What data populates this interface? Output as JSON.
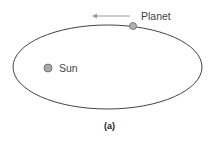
{
  "diagram": {
    "orbit": {
      "cx": 107.5,
      "cy": 67,
      "rx": 94.5,
      "ry": 42,
      "stroke": "#444444"
    },
    "planet": {
      "label": "Planet",
      "cx": 133,
      "cy": 26,
      "r": 3.5,
      "fill": "#b0b0b0"
    },
    "sun": {
      "label": "Sun",
      "cx": 48,
      "cy": 68,
      "r": 4,
      "fill": "#a8a8a8"
    },
    "motion_arrow": {
      "direction": "left",
      "x1": 130,
      "x2": 92,
      "y": 16,
      "color": "#999999"
    },
    "caption": "(a)"
  }
}
